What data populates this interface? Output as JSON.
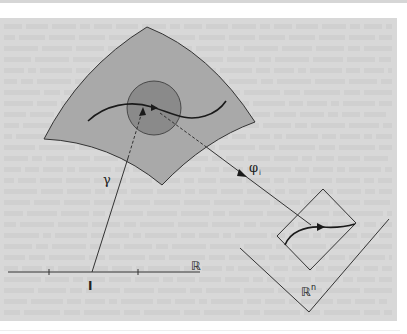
{
  "figure": {
    "colors": {
      "page": "#ffffff",
      "panel": "#d8d8d8",
      "surface": "#a9a9a9",
      "chart_disk": "#8a8a8a",
      "stroke": "#333333",
      "curve": "#1a1a1a",
      "texture": "#cacaca"
    },
    "labels": {
      "gamma": "γ",
      "phi": "φ",
      "phi_sub": "i",
      "real_line": "ℝ",
      "interval": "I",
      "rn": "ℝ",
      "rn_sup": "n"
    },
    "geometry": {
      "surface_path": "M147,27 Q210,52 255,122 Q205,140 162,185 Q110,142 44,139 Q80,68 147,27 Z",
      "disk": {
        "cx": 154,
        "cy": 108,
        "r": 27
      },
      "surface_curve": "M88,121 C105,105 130,100 152,107 C172,113 185,122 205,116 C215,113 222,107 226,101",
      "real_axis": {
        "x1": 8,
        "y1": 272,
        "x2": 200,
        "y2": 272
      },
      "ticks": [
        {
          "x": 49,
          "y": 272
        },
        {
          "x": 138,
          "y": 272
        }
      ],
      "gamma_solid": {
        "x1": 92,
        "y1": 272,
        "x2": 128,
        "y2": 158
      },
      "gamma_dashed": {
        "x1": 128,
        "y1": 158,
        "x2": 142,
        "y2": 112
      },
      "gamma_arrow": "M143,107 L139,116 L146,115 Z",
      "inner_arrow": "M158,108 L151,104 L151,111 Z",
      "phi_dashed": {
        "x1": 160,
        "y1": 113,
        "x2": 205,
        "y2": 146
      },
      "phi_solid": {
        "x1": 205,
        "y1": 146,
        "x2": 311,
        "y2": 225
      },
      "phi_arrow": "M247,177 L239,169 L237,176 Z",
      "chart_square": "M323,189 L356,223 L310,270 L277,236 Z",
      "image_curve": "M285,245 C290,232 305,226 322,227 C335,228 345,227 355,224",
      "image_arrow": "M325,227 L317,223 L317,231 Z",
      "rn_wedge": "M240,248 L309,312 L389,219"
    },
    "label_positions": {
      "gamma": {
        "x": 103,
        "y": 184
      },
      "phi": {
        "x": 249,
        "y": 172
      },
      "phi_sub": {
        "x": 259,
        "y": 175
      },
      "real_line": {
        "x": 191,
        "y": 270
      },
      "interval": {
        "x": 88,
        "y": 290
      },
      "rn": {
        "x": 301,
        "y": 296
      },
      "rn_sup": {
        "x": 311,
        "y": 290
      }
    }
  }
}
